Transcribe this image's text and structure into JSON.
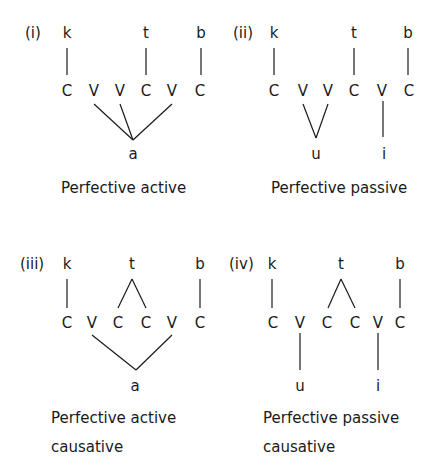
{
  "panels": [
    {
      "number": "(i)",
      "root": [
        "k",
        "t",
        "b"
      ],
      "skeleton": [
        "C",
        "V",
        "V",
        "C",
        "V",
        "C"
      ],
      "vowels": [
        "a"
      ],
      "caption": [
        "Perfective active"
      ]
    },
    {
      "number": "(ii)",
      "root": [
        "k",
        "t",
        "b"
      ],
      "skeleton": [
        "C",
        "V",
        "V",
        "C",
        "V",
        "C"
      ],
      "vowels": [
        "u",
        "i"
      ],
      "caption": [
        "Perfective passive"
      ]
    },
    {
      "number": "(iii)",
      "root": [
        "k",
        "t",
        "b"
      ],
      "skeleton": [
        "C",
        "V",
        "C",
        "C",
        "V",
        "C"
      ],
      "vowels": [
        "a"
      ],
      "caption": [
        "Perfective active",
        "causative"
      ]
    },
    {
      "number": "(iv)",
      "root": [
        "k",
        "t",
        "b"
      ],
      "skeleton": [
        "C",
        "V",
        "C",
        "C",
        "V",
        "C"
      ],
      "vowels": [
        "u",
        "i"
      ],
      "caption": [
        "Perfective passive",
        "causative"
      ]
    }
  ]
}
